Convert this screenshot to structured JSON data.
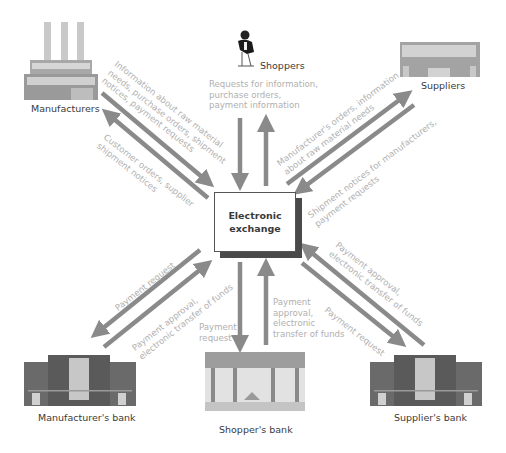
{
  "diagram": {
    "hub": {
      "line1": "Electronic",
      "line2": "exchange"
    },
    "nodes": {
      "manufacturers": "Manufacturers",
      "shoppers": "Shoppers",
      "suppliers": "Suppliers",
      "manufacturers_bank": "Manufacturer's  bank",
      "shoppers_bank": "Shopper's  bank",
      "suppliers_bank": "Supplier's bank"
    },
    "flows": {
      "manufacturers_to_hub": [
        "Information about raw material",
        "needs, purchase orders, shipment",
        "notices, payment requests"
      ],
      "hub_to_manufacturers": [
        "Customer orders, supplier",
        "shipment notices"
      ],
      "shoppers_hub": [
        "Requests for information,",
        "purchase orders,",
        "payment information"
      ],
      "hub_to_suppliers": [
        "Manufacturer's orders, information",
        "about raw material needs"
      ],
      "suppliers_to_hub": [
        "Shipment notices for manufacturers,",
        "payment requests"
      ],
      "hub_to_manufacturers_bank": [
        "Payment request"
      ],
      "manufacturers_bank_to_hub": [
        "Payment approval,",
        "electronic transfer of funds"
      ],
      "hub_to_shoppers_bank": [
        "Payment",
        "request"
      ],
      "shoppers_bank_to_hub": [
        "Payment",
        "approval,",
        "electronic",
        "transfer of funds"
      ],
      "suppliers_bank_to_hub": [
        "Payment approval,",
        "electronic transfer of funds"
      ],
      "hub_to_suppliers_bank": [
        "Payment request"
      ]
    },
    "colors": {
      "arrow": "#8a8a8a",
      "flow_text": "#b0b0b0",
      "building": "#6e6e6e",
      "hub_border": "#555555"
    }
  }
}
